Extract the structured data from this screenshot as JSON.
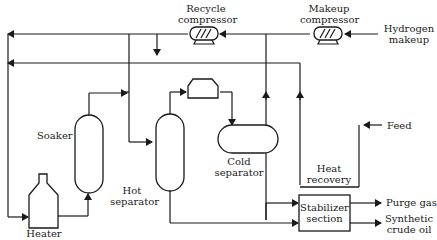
{
  "diagram": {
    "equipment": {
      "recycle_compressor": {
        "line1": "Recycle",
        "line2": "compressor"
      },
      "makeup_compressor": {
        "line1": "Makeup",
        "line2": "compressor"
      },
      "soaker": {
        "label": "Soaker"
      },
      "hot_separator": {
        "line1": "Hot",
        "line2": "separator"
      },
      "cold_separator": {
        "line1": "Cold",
        "line2": "separator"
      },
      "heater": {
        "label": "Heater"
      },
      "heat_recovery": {
        "line1": "Heat",
        "line2": "recovery"
      },
      "stabilizer": {
        "line1": "Stabilizer",
        "line2": "section"
      }
    },
    "streams": {
      "hydrogen_makeup": {
        "line1": "Hydrogen",
        "line2": "makeup"
      },
      "feed": {
        "label": "Feed"
      },
      "purge_gas": {
        "label": "Purge gas"
      },
      "synthetic_crude": {
        "line1": "Synthetic",
        "line2": "crude oil"
      }
    },
    "colors": {
      "line": "#1a1a1a",
      "background": "#ffffff"
    }
  }
}
